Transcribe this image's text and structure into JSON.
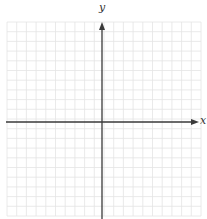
{
  "diagram": {
    "type": "coordinate-plane",
    "x_axis_label": "x",
    "y_axis_label": "y",
    "grid": {
      "cells_left_of_y_axis": 10,
      "cells_right_of_y_axis": 10,
      "cells_above_x_axis": 10,
      "cells_below_x_axis": 10,
      "cell_size_px": 9.7,
      "left_px": 7,
      "top_px": 22,
      "origin_px": [
        102,
        122
      ]
    },
    "colors": {
      "grid_line": "#e4e4e4",
      "axis": "#3a3a3a",
      "label": "#333333",
      "background": "#ffffff"
    }
  }
}
